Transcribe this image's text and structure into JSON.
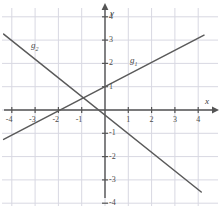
{
  "chart_data": {
    "type": "line",
    "title": "",
    "xlabel": "x",
    "ylabel": "y",
    "xlim": [
      -4.6,
      5.0
    ],
    "ylim": [
      -4.6,
      4.4
    ],
    "grid": true,
    "legend": "inline-labels",
    "x_ticks": [
      -4,
      -3,
      -2,
      -1,
      1,
      2,
      3,
      4
    ],
    "y_ticks": [
      -4,
      -3,
      -2,
      -1,
      1,
      2,
      3,
      4
    ],
    "x_tick_labels": [
      "-4",
      "-3",
      "-2",
      "-1",
      "1",
      "2",
      "3",
      "4"
    ],
    "y_tick_labels": [
      "-4",
      "-3",
      "-2",
      "-1",
      "1",
      "2",
      "3",
      "4"
    ],
    "series": [
      {
        "name": "g1",
        "label": "g",
        "subscript": "1",
        "slope": 0.52,
        "intercept": 1.0,
        "x_start": -4.35,
        "x_end": 4.25,
        "y_start": -1.26,
        "y_end": 3.21,
        "color": "#5a5a5a"
      },
      {
        "name": "g2",
        "label": "g",
        "subscript": "2",
        "slope": -0.8,
        "intercept": -0.22,
        "x_start": -4.35,
        "x_end": 4.13,
        "y_start": 3.26,
        "y_end": -3.52,
        "color": "#5a5a5a"
      }
    ],
    "intersection": {
      "x": -0.7,
      "y": 0.33
    }
  },
  "axes": {
    "x_axis_name": "x",
    "y_axis_name": "y",
    "axis_color": "#555555",
    "grid_color": "#d8d8e2"
  },
  "labels": {
    "g1_text": "g",
    "g1_sub": "1",
    "g2_text": "g",
    "g2_sub": "2"
  }
}
